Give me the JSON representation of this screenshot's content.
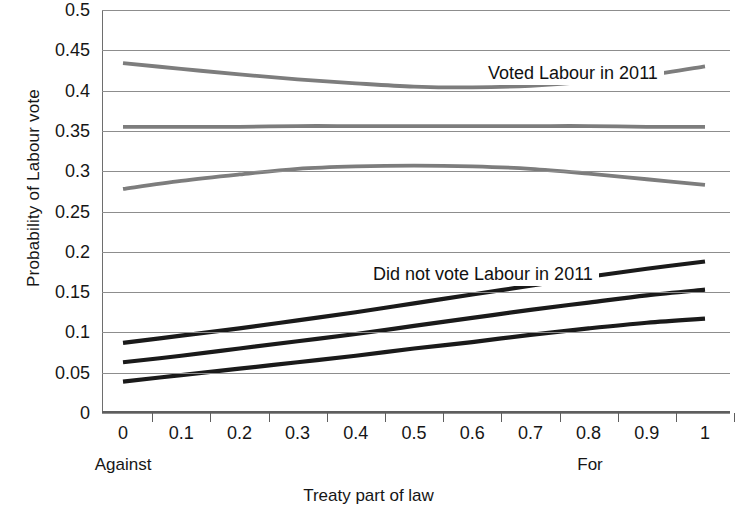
{
  "chart_data": {
    "type": "line",
    "title": "",
    "xlabel": "Treaty part of law",
    "ylabel": "Probability of Labour vote",
    "xlim": [
      0,
      1
    ],
    "ylim": [
      0,
      0.5
    ],
    "grid": true,
    "legend_position": "none",
    "x_tick_labels": [
      "0",
      "0.1",
      "0.2",
      "0.3",
      "0.4",
      "0.5",
      "0.6",
      "0.7",
      "0.8",
      "0.9",
      "1"
    ],
    "y_tick_labels": [
      "0.5",
      "0.45",
      "0.4",
      "0.35",
      "0.3",
      "0.25",
      "0.2",
      "0.15",
      "0.1",
      "0.05",
      "0"
    ],
    "x_axis_anchor_low": "Against",
    "x_axis_anchor_high": "For",
    "annotations": [
      {
        "name": "voted-labour",
        "text": "Voted Labour in 2011",
        "x": 0.49,
        "y": 0.432
      },
      {
        "name": "did-not-vote-labour",
        "text": "Did not vote Labour in 2011",
        "x": 0.38,
        "y": 0.185
      }
    ],
    "colors": {
      "voted_labour_line": "#7d7d7d",
      "did_not_vote_line": "#1a1a1a",
      "gridline": "#8d8d8d",
      "axis": "#5e5e5e",
      "background": "#ffffff"
    },
    "x": [
      0,
      0.1,
      0.2,
      0.3,
      0.4,
      0.5,
      0.6,
      0.7,
      0.8,
      0.9,
      1
    ],
    "series": [
      {
        "name": "Voted Labour in 2011 — upper bound",
        "group": "Voted Labour in 2011",
        "color": "#7d7d7d",
        "values": [
          0.434,
          0.427,
          0.42,
          0.414,
          0.409,
          0.405,
          0.404,
          0.406,
          0.411,
          0.419,
          0.43
        ]
      },
      {
        "name": "Voted Labour in 2011 — point estimate",
        "group": "Voted Labour in 2011",
        "color": "#7d7d7d",
        "values": [
          0.355,
          0.355,
          0.355,
          0.356,
          0.356,
          0.356,
          0.356,
          0.356,
          0.356,
          0.355,
          0.355
        ]
      },
      {
        "name": "Voted Labour in 2011 — lower bound",
        "group": "Voted Labour in 2011",
        "color": "#7d7d7d",
        "values": [
          0.278,
          0.288,
          0.296,
          0.303,
          0.306,
          0.307,
          0.306,
          0.303,
          0.297,
          0.29,
          0.283
        ]
      },
      {
        "name": "Did not vote Labour in 2011 — upper bound",
        "group": "Did not vote Labour in 2011",
        "color": "#1a1a1a",
        "values": [
          0.087,
          0.096,
          0.105,
          0.115,
          0.125,
          0.136,
          0.147,
          0.158,
          0.169,
          0.179,
          0.188
        ]
      },
      {
        "name": "Did not vote Labour in 2011 — point estimate",
        "group": "Did not vote Labour in 2011",
        "color": "#1a1a1a",
        "values": [
          0.063,
          0.071,
          0.08,
          0.089,
          0.098,
          0.108,
          0.118,
          0.128,
          0.137,
          0.146,
          0.153
        ]
      },
      {
        "name": "Did not vote Labour in 2011 — lower bound",
        "group": "Did not vote Labour in 2011",
        "color": "#1a1a1a",
        "values": [
          0.039,
          0.047,
          0.055,
          0.063,
          0.071,
          0.08,
          0.088,
          0.097,
          0.105,
          0.112,
          0.117
        ]
      }
    ]
  }
}
